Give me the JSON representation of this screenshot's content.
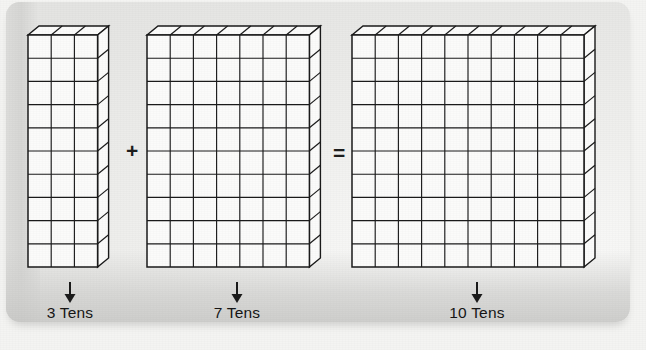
{
  "figure": {
    "type": "base-ten-blocks-place-value-addition",
    "equation_text": "3 Tens + 7 Tens = 10 Tens",
    "line_color": "#1b1b1b",
    "face_color": "#fbfbfa",
    "background_color": "#e9e9e7"
  },
  "operators": {
    "plus": "+",
    "equals": "="
  },
  "groups": [
    {
      "id": "group-3-tens",
      "label": "3 Tens",
      "columns": 3,
      "rows": 10,
      "unit_value": 10,
      "total": 30,
      "arrow": "down-arrow"
    },
    {
      "id": "group-7-tens",
      "label": "7 Tens",
      "columns": 7,
      "rows": 10,
      "unit_value": 10,
      "total": 70,
      "arrow": "down-arrow"
    },
    {
      "id": "group-10-tens",
      "label": "10 Tens",
      "columns": 10,
      "rows": 10,
      "unit_value": 10,
      "total": 100,
      "arrow": "down-arrow"
    }
  ]
}
